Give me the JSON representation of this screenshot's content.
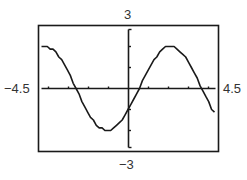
{
  "chart_data": {
    "type": "line",
    "title": "",
    "xlabel": "",
    "ylabel": "",
    "xlim": [
      -4.5,
      4.5
    ],
    "ylim": [
      -3,
      3
    ],
    "x_tick_step": 1,
    "y_tick_step": 1,
    "grid": false,
    "legend": null,
    "window_labels": {
      "xmin": "−4.5",
      "xmax": "4.5",
      "ymax": "3",
      "ymin": "−3"
    },
    "series": [
      {
        "name": "y = 2 sin(x − π/6)",
        "amplitude": 2,
        "phase_shift": 0.5236,
        "period": 6.2832,
        "points": [
          {
            "x": -4.5,
            "y": 1.9
          },
          {
            "x": -3.66,
            "y": 2.0
          },
          {
            "x": -2.62,
            "y": 0.0
          },
          {
            "x": -1.05,
            "y": -2.0
          },
          {
            "x": 0.0,
            "y": -1.0
          },
          {
            "x": 0.52,
            "y": 0.0
          },
          {
            "x": 2.09,
            "y": 2.0
          },
          {
            "x": 3.67,
            "y": 0.0
          },
          {
            "x": 4.5,
            "y": -1.5
          }
        ]
      }
    ]
  }
}
